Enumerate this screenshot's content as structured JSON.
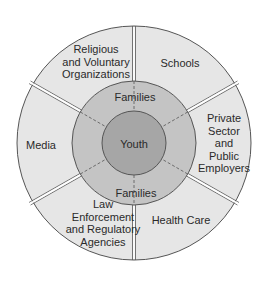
{
  "diagram": {
    "type": "concentric-circles",
    "center": {
      "label": "Youth",
      "color": "#a6a6a6"
    },
    "middle_ring": {
      "labels": [
        "Families",
        "Families"
      ],
      "color": "#c4c4c4"
    },
    "outer_ring": {
      "color": "#e6e6e6",
      "sectors": [
        {
          "id": "religious",
          "label": "Religious\nand Voluntary\nOrganizations"
        },
        {
          "id": "schools",
          "label": "Schools"
        },
        {
          "id": "employers",
          "label": "Private\nSector\nand\nPublic\nEmployers"
        },
        {
          "id": "health",
          "label": "Health Care"
        },
        {
          "id": "law",
          "label": "Law\nEnforcement\nand Regulatory\nAgencies"
        },
        {
          "id": "media",
          "label": "Media"
        }
      ]
    },
    "colors": {
      "stroke": "#555555",
      "background": "#ffffff",
      "text": "#2a2a2a"
    }
  }
}
